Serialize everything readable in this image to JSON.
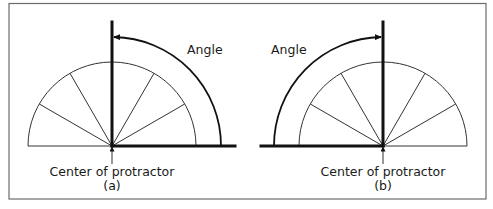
{
  "figure": {
    "panels": [
      {
        "id": "a",
        "caption": "(a)",
        "center_label": "Center of protractor",
        "angle_label": "Angle",
        "orientation": "protractor-left-and-right, arm sweeps from right baseline to vertical",
        "colors": {
          "line": "#111111",
          "frame": "#6b6b6b"
        }
      },
      {
        "id": "b",
        "caption": "(b)",
        "center_label": "Center of protractor",
        "angle_label": "Angle",
        "orientation": "arm sweeps from left baseline to vertical",
        "colors": {
          "line": "#111111",
          "frame": "#6b6b6b"
        }
      }
    ]
  }
}
